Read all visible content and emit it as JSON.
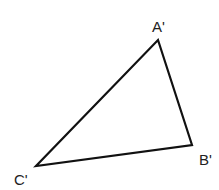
{
  "diagram": {
    "type": "triangle",
    "vertices": [
      {
        "label": "A'",
        "x": 158,
        "y": 40,
        "label_x": 152,
        "label_y": 32
      },
      {
        "label": "B'",
        "x": 192,
        "y": 145,
        "label_x": 199,
        "label_y": 165
      },
      {
        "label": "C'",
        "x": 36,
        "y": 166,
        "label_x": 14,
        "label_y": 185
      }
    ],
    "stroke_color": "#111111",
    "stroke_width": 2.2
  }
}
